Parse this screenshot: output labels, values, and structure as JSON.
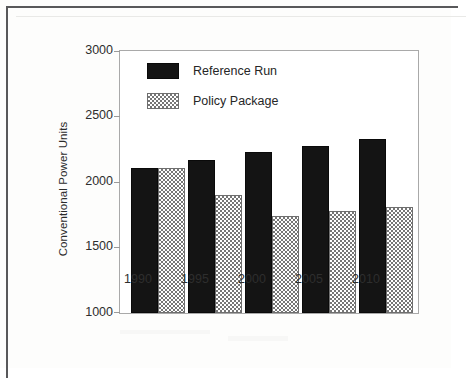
{
  "chart_data": {
    "type": "bar",
    "title": "",
    "xlabel": "",
    "ylabel": "Conventional Power Units",
    "categories": [
      "1990",
      "1995",
      "2000",
      "2005",
      "2010"
    ],
    "ylim": [
      1000,
      3000
    ],
    "yticks": [
      1000,
      1500,
      2000,
      2500,
      3000
    ],
    "ytick_labels": [
      "1000",
      "1500",
      "2000",
      "2500",
      "3000"
    ],
    "grid": false,
    "legend_position": "upper-left-inside",
    "series": [
      {
        "name": "Reference Run",
        "color": "#141414",
        "pattern": "solid",
        "values": [
          2105,
          2165,
          2230,
          2275,
          2325
        ]
      },
      {
        "name": "Policy Package",
        "color": "#767676",
        "pattern": "checkerboard",
        "values": [
          2105,
          1900,
          1740,
          1780,
          1810
        ]
      }
    ]
  },
  "legend": {
    "items": [
      {
        "label": "Reference Run",
        "swatch": "solid-black-swatch"
      },
      {
        "label": "Policy Package",
        "swatch": "checkered-gray-swatch"
      }
    ]
  },
  "axes": {
    "y_title": "Conventional Power Units",
    "y_tick_labels": [
      "3000",
      "2500",
      "2000",
      "1500",
      "1000"
    ],
    "x_tick_labels": [
      "1990",
      "1995",
      "2000",
      "2005",
      "2010"
    ]
  }
}
